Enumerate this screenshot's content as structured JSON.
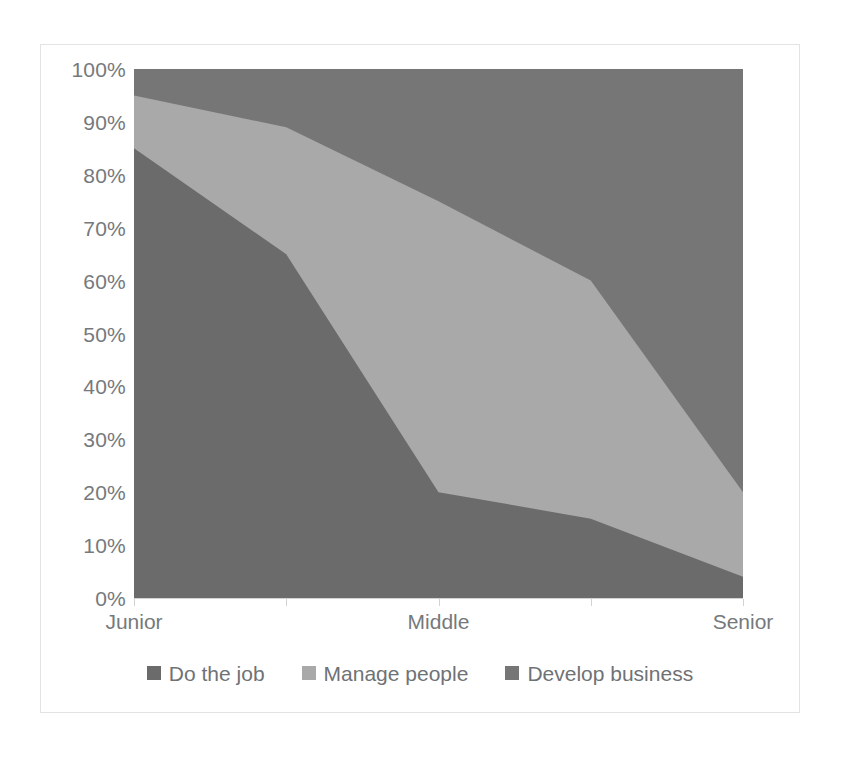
{
  "chart_data": {
    "type": "area",
    "stacked": true,
    "normalized_percent": true,
    "title": "",
    "xlabel": "",
    "ylabel": "",
    "categories": [
      "Junior",
      "",
      "Middle",
      "",
      "Senior"
    ],
    "tick_labels_shown": [
      "Junior",
      "Middle",
      "Senior"
    ],
    "x_tick_count": 5,
    "ylim": [
      0,
      100
    ],
    "y_ticks": [
      0,
      10,
      20,
      30,
      40,
      50,
      60,
      70,
      80,
      90,
      100
    ],
    "y_tick_labels": [
      "0%",
      "10%",
      "20%",
      "30%",
      "40%",
      "50%",
      "60%",
      "70%",
      "80%",
      "90%",
      "100%"
    ],
    "grid": false,
    "legend_position": "bottom",
    "series": [
      {
        "name": "Do the job",
        "color": "#6b6b6b",
        "values": [
          85,
          65,
          20,
          15,
          4
        ]
      },
      {
        "name": "Manage people",
        "color": "#a9a9a9",
        "values": [
          10,
          24,
          55,
          45,
          16
        ]
      },
      {
        "name": "Develop business",
        "color": "#767676",
        "values": [
          5,
          11,
          25,
          40,
          80
        ]
      }
    ],
    "cumulative_tops": {
      "do_the_job": [
        85,
        65,
        20,
        15,
        4
      ],
      "manage_people": [
        95,
        89,
        75,
        60,
        20
      ],
      "develop_business": [
        100,
        100,
        100,
        100,
        100
      ]
    }
  },
  "axis": {
    "y_labels": [
      "100%",
      "90%",
      "80%",
      "70%",
      "60%",
      "50%",
      "40%",
      "30%",
      "20%",
      "10%",
      "0%"
    ],
    "x_labels": [
      "Junior",
      "Middle",
      "Senior"
    ]
  },
  "legend": {
    "items": [
      {
        "label": "Do the job",
        "color": "#6b6b6b"
      },
      {
        "label": "Manage people",
        "color": "#a9a9a9"
      },
      {
        "label": "Develop business",
        "color": "#767676"
      }
    ]
  },
  "colors": {
    "do_the_job": "#6b6b6b",
    "manage_people": "#a9a9a9",
    "develop_business": "#767676",
    "axis_text": "#76797c",
    "axis_line": "#d3d3d6",
    "frame_border": "#e3e3e6"
  }
}
